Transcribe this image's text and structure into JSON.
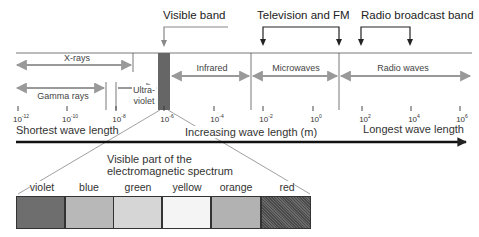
{
  "diagram": {
    "title": "Electromagnetic spectrum",
    "callouts": {
      "visible_band": "Visible band",
      "television_fm": "Television and FM",
      "radio_broadcast": "Radio broadcast band"
    },
    "regions": [
      {
        "name": "X-rays"
      },
      {
        "name": "Gamma rays"
      },
      {
        "name": "Ultra-",
        "name_line2": "violet"
      },
      {
        "name": "Infrared"
      },
      {
        "name": "Microwaves"
      },
      {
        "name": "Radio waves"
      }
    ],
    "ticks": [
      {
        "base": "10",
        "exp": "-12"
      },
      {
        "base": "10",
        "exp": "-10"
      },
      {
        "base": "10",
        "exp": "-8"
      },
      {
        "base": "10",
        "exp": "-6"
      },
      {
        "base": "10",
        "exp": "-4"
      },
      {
        "base": "10",
        "exp": "-2"
      },
      {
        "base": "10",
        "exp": "0"
      },
      {
        "base": "10",
        "exp": "2"
      },
      {
        "base": "10",
        "exp": "4"
      },
      {
        "base": "10",
        "exp": "6"
      }
    ],
    "axis": {
      "left_label": "Shortest wave length",
      "center_label": "Increasing wave length (m)",
      "right_label": "Longest wave length"
    },
    "visible_detail": {
      "caption_line1": "Visible part of the",
      "caption_line2": "electromagnetic spectrum",
      "colors": [
        {
          "label": "violet",
          "fill": "#6e6e6e"
        },
        {
          "label": "blue",
          "fill": "#b8b8b8"
        },
        {
          "label": "green",
          "fill": "#d6d6d6"
        },
        {
          "label": "yellow",
          "fill": "#f4f4f4"
        },
        {
          "label": "orange",
          "fill": "#b2b2b2"
        },
        {
          "label": "red",
          "fill": "#555555"
        }
      ]
    },
    "colors": {
      "line": "#555555",
      "region_arrow": "#999999",
      "visible_band_fill": "#666666",
      "axis_arrow": "#111111"
    }
  }
}
